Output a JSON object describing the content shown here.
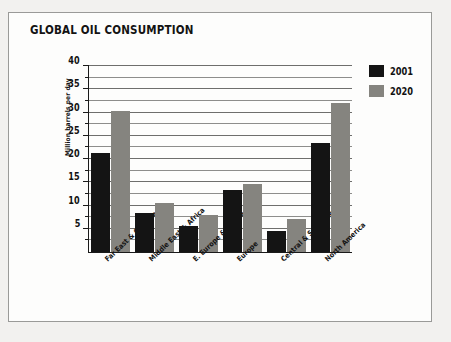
{
  "figure": {
    "title": "GLOBAL OIL CONSUMPTION"
  },
  "legend": {
    "position": "top-right",
    "items": [
      {
        "label": "2001",
        "color": "#141414"
      },
      {
        "label": "2020",
        "color": "#85847f"
      }
    ]
  },
  "axes": {
    "y_title": "Million barrels per day",
    "y_ticks": [
      "5",
      "10",
      "15",
      "20",
      "25",
      "30",
      "35",
      "40"
    ]
  },
  "chart_data": {
    "type": "bar",
    "title": "GLOBAL OIL CONSUMPTION",
    "xlabel": "",
    "ylabel": "Million barrels per day",
    "ylim": [
      0,
      40
    ],
    "ytick_step": 5,
    "yminor_step": 2.5,
    "grid": true,
    "legend_position": "top-right",
    "categories": [
      "Far East & Oceania",
      "Middle East & Africa",
      "E. Europe & Russia",
      "Europe",
      "Central & South America",
      "North America"
    ],
    "series": [
      {
        "name": "2001",
        "color": "#141414",
        "values": [
          21.3,
          8.3,
          5.7,
          13.4,
          4.5,
          23.4
        ]
      },
      {
        "name": "2020",
        "color": "#85847f",
        "values": [
          30.4,
          10.6,
          8.0,
          14.6,
          7.0,
          32.0
        ]
      }
    ]
  }
}
